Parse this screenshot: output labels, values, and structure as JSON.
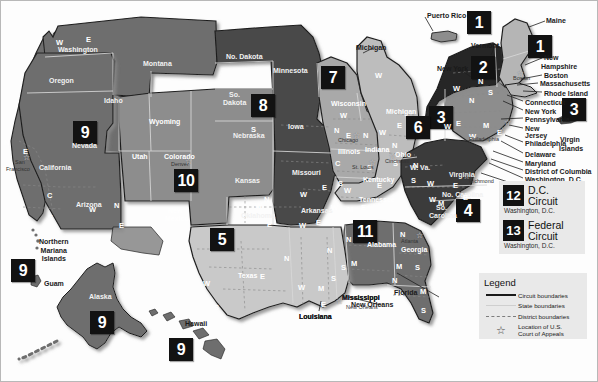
{
  "legend": {
    "title": "Legend",
    "items": [
      {
        "key": "circuit-boundary-line",
        "label": "Circuit boundaries"
      },
      {
        "key": "state-boundary-line",
        "label": "State boundaries"
      },
      {
        "key": "district-boundary-line",
        "label": "District boundaries"
      },
      {
        "key": "court-location-star",
        "label": "Location of U.S.\nCourt of Appeals"
      }
    ],
    "court_location_line1": "Location of U.S.",
    "court_location_line2": "Court of Appeals"
  },
  "special_circuits": [
    {
      "number": "12",
      "name_line1": "D.C.",
      "name_line2": "Circuit",
      "city": "Washington, D.C."
    },
    {
      "number": "13",
      "name_line1": "Federal",
      "name_line2": "Circuit",
      "city": "Washington, D.C."
    }
  ],
  "circuit_badges": [
    {
      "number": "1",
      "x": 466,
      "y": 10,
      "size": "lg",
      "name": "circuit-badge-1-puerto-rico"
    },
    {
      "number": "1",
      "x": 527,
      "y": 34,
      "size": "lg",
      "name": "circuit-badge-1-new-england"
    },
    {
      "number": "2",
      "x": 470,
      "y": 55,
      "size": "lg",
      "name": "circuit-badge-2"
    },
    {
      "number": "3",
      "x": 428,
      "y": 105,
      "size": "lg",
      "name": "circuit-badge-3-pennsylvania"
    },
    {
      "number": "3",
      "x": 561,
      "y": 97,
      "size": "lg",
      "name": "circuit-badge-3-virgin-islands"
    },
    {
      "number": "4",
      "x": 455,
      "y": 198,
      "size": "lg",
      "name": "circuit-badge-4"
    },
    {
      "number": "5",
      "x": 209,
      "y": 227,
      "size": "lg",
      "name": "circuit-badge-5"
    },
    {
      "number": "6",
      "x": 405,
      "y": 115,
      "size": "lg",
      "name": "circuit-badge-6"
    },
    {
      "number": "7",
      "x": 320,
      "y": 65,
      "size": "lg",
      "name": "circuit-badge-7"
    },
    {
      "number": "8",
      "x": 250,
      "y": 93,
      "size": "lg",
      "name": "circuit-badge-8"
    },
    {
      "number": "9",
      "x": 72,
      "y": 120,
      "size": "lg",
      "name": "circuit-badge-9-nevada"
    },
    {
      "number": "9",
      "x": 10,
      "y": 258,
      "size": "lg",
      "name": "circuit-badge-9-northern-mariana"
    },
    {
      "number": "9",
      "x": 89,
      "y": 310,
      "size": "lg",
      "name": "circuit-badge-9-alaska"
    },
    {
      "number": "9",
      "x": 168,
      "y": 337,
      "size": "lg",
      "name": "circuit-badge-9-hawaii"
    },
    {
      "number": "10",
      "x": 173,
      "y": 168,
      "size": "lg",
      "name": "circuit-badge-10"
    },
    {
      "number": "11",
      "x": 352,
      "y": 219,
      "size": "lg",
      "name": "circuit-badge-11"
    }
  ],
  "state_labels": [
    {
      "text": "Washington",
      "x": 57,
      "y": 45,
      "tone": "dk"
    },
    {
      "text": "Oregon",
      "x": 48,
      "y": 76,
      "tone": "dk"
    },
    {
      "text": "Idaho",
      "x": 103,
      "y": 96,
      "tone": "dk"
    },
    {
      "text": "Montana",
      "x": 142,
      "y": 59,
      "tone": "dk"
    },
    {
      "text": "Wyoming",
      "x": 148,
      "y": 117,
      "tone": "lt"
    },
    {
      "text": "Nevada",
      "x": 71,
      "y": 141,
      "tone": "dk"
    },
    {
      "text": "California",
      "x": 38,
      "y": 163,
      "tone": "dk"
    },
    {
      "text": "Utah",
      "x": 131,
      "y": 152,
      "tone": "lt"
    },
    {
      "text": "Colorado",
      "x": 163,
      "y": 152,
      "tone": "lt"
    },
    {
      "text": "Arizona",
      "x": 75,
      "y": 200,
      "tone": "dk"
    },
    {
      "text": "New",
      "x": 167,
      "y": 206,
      "tone": "lt"
    },
    {
      "text": "Mexico",
      "x": 164,
      "y": 214,
      "tone": "lt"
    },
    {
      "text": "No. Dakota",
      "x": 225,
      "y": 52,
      "tone": "dk"
    },
    {
      "text": "So.",
      "x": 228,
      "y": 90,
      "tone": "dk"
    },
    {
      "text": "Dakota",
      "x": 222,
      "y": 98,
      "tone": "dk"
    },
    {
      "text": "Nebraska",
      "x": 232,
      "y": 131,
      "tone": "dk"
    },
    {
      "text": "Kansas",
      "x": 234,
      "y": 176,
      "tone": "dk"
    },
    {
      "text": "Oklahoma",
      "x": 240,
      "y": 211,
      "tone": "dk"
    },
    {
      "text": "Minnesota",
      "x": 272,
      "y": 66,
      "tone": "dk"
    },
    {
      "text": "Iowa",
      "x": 287,
      "y": 122,
      "tone": "dk"
    },
    {
      "text": "Missouri",
      "x": 291,
      "y": 168,
      "tone": "dk"
    },
    {
      "text": "Arkansas",
      "x": 300,
      "y": 206,
      "tone": "dk"
    },
    {
      "text": "Texas",
      "x": 237,
      "y": 271,
      "tone": "lt"
    },
    {
      "text": "Louisiana",
      "x": 298,
      "y": 312,
      "tone": "out"
    },
    {
      "text": "Mississippi",
      "x": 341,
      "y": 293,
      "tone": "out"
    },
    {
      "text": "Wisconsin",
      "x": 330,
      "y": 99,
      "tone": "lt"
    },
    {
      "text": "Michigan",
      "x": 355,
      "y": 43,
      "tone": "out"
    },
    {
      "text": "Michigan",
      "x": 385,
      "y": 107,
      "tone": "lt"
    },
    {
      "text": "Illinois",
      "x": 337,
      "y": 147,
      "tone": "lt"
    },
    {
      "text": "Indiana",
      "x": 364,
      "y": 145,
      "tone": "lt"
    },
    {
      "text": "Ohio",
      "x": 394,
      "y": 150,
      "tone": "lt"
    },
    {
      "text": "Kentucky",
      "x": 362,
      "y": 175,
      "tone": "lt"
    },
    {
      "text": "Tennessee",
      "x": 358,
      "y": 195,
      "tone": "lt"
    },
    {
      "text": "Alabama",
      "x": 366,
      "y": 240,
      "tone": "lt"
    },
    {
      "text": "Georgia",
      "x": 400,
      "y": 245,
      "tone": "lt"
    },
    {
      "text": "Florida",
      "x": 393,
      "y": 288,
      "tone": "out"
    },
    {
      "text": "W. Va.",
      "x": 409,
      "y": 163,
      "tone": "dk"
    },
    {
      "text": "Virginia",
      "x": 448,
      "y": 170,
      "tone": "dk"
    },
    {
      "text": "No. Carolina",
      "x": 441,
      "y": 190,
      "tone": "dk"
    },
    {
      "text": "So.",
      "x": 435,
      "y": 203,
      "tone": "dk"
    },
    {
      "text": "Carolina",
      "x": 428,
      "y": 211,
      "tone": "dk"
    },
    {
      "text": "Alaska",
      "x": 88,
      "y": 292,
      "tone": "dk"
    },
    {
      "text": "Hawaii",
      "x": 184,
      "y": 319,
      "tone": "out"
    }
  ],
  "district_letters": [
    {
      "text": "W",
      "x": 55,
      "y": 37
    },
    {
      "text": "E",
      "x": 85,
      "y": 34
    },
    {
      "text": "N",
      "x": 3,
      "y": 137
    },
    {
      "text": "E",
      "x": 22,
      "y": 146
    },
    {
      "text": "C",
      "x": 46,
      "y": 190
    },
    {
      "text": "S",
      "x": 47,
      "y": 212
    },
    {
      "text": "W",
      "x": 88,
      "y": 204
    },
    {
      "text": "N",
      "x": 113,
      "y": 200
    },
    {
      "text": "E",
      "x": 118,
      "y": 220
    },
    {
      "text": "W",
      "x": 254,
      "y": 200
    },
    {
      "text": "N",
      "x": 263,
      "y": 194
    },
    {
      "text": "E",
      "x": 266,
      "y": 219
    },
    {
      "text": "W",
      "x": 299,
      "y": 189
    },
    {
      "text": "E",
      "x": 321,
      "y": 182
    },
    {
      "text": "W",
      "x": 298,
      "y": 220
    },
    {
      "text": "E",
      "x": 315,
      "y": 217
    },
    {
      "text": "N",
      "x": 283,
      "y": 253
    },
    {
      "text": "W",
      "x": 202,
      "y": 278
    },
    {
      "text": "S",
      "x": 213,
      "y": 302
    },
    {
      "text": "E",
      "x": 259,
      "y": 271
    },
    {
      "text": "W",
      "x": 297,
      "y": 282
    },
    {
      "text": "M",
      "x": 317,
      "y": 283
    },
    {
      "text": "E",
      "x": 320,
      "y": 299
    },
    {
      "text": "N",
      "x": 326,
      "y": 245
    },
    {
      "text": "S",
      "x": 330,
      "y": 273
    },
    {
      "text": "W",
      "x": 339,
      "y": 110
    },
    {
      "text": "E",
      "x": 345,
      "y": 130
    },
    {
      "text": "N",
      "x": 333,
      "y": 125
    },
    {
      "text": "C",
      "x": 334,
      "y": 158
    },
    {
      "text": "S",
      "x": 337,
      "y": 178
    },
    {
      "text": "N",
      "x": 362,
      "y": 130
    },
    {
      "text": "S",
      "x": 366,
      "y": 162
    },
    {
      "text": "W",
      "x": 343,
      "y": 185
    },
    {
      "text": "E",
      "x": 376,
      "y": 180
    },
    {
      "text": "W",
      "x": 330,
      "y": 202
    },
    {
      "text": "M",
      "x": 346,
      "y": 204
    },
    {
      "text": "E",
      "x": 360,
      "y": 202
    },
    {
      "text": "W",
      "x": 374,
      "y": 70
    },
    {
      "text": "W",
      "x": 378,
      "y": 127
    },
    {
      "text": "E",
      "x": 396,
      "y": 120
    },
    {
      "text": "N",
      "x": 391,
      "y": 140
    },
    {
      "text": "S",
      "x": 392,
      "y": 158
    },
    {
      "text": "N",
      "x": 345,
      "y": 234
    },
    {
      "text": "M",
      "x": 350,
      "y": 258
    },
    {
      "text": "S",
      "x": 340,
      "y": 262
    },
    {
      "text": "N",
      "x": 399,
      "y": 229
    },
    {
      "text": "M",
      "x": 395,
      "y": 261
    },
    {
      "text": "S",
      "x": 414,
      "y": 262
    },
    {
      "text": "N",
      "x": 391,
      "y": 275
    },
    {
      "text": "M",
      "x": 419,
      "y": 286
    },
    {
      "text": "S",
      "x": 420,
      "y": 305
    },
    {
      "text": "N",
      "x": 412,
      "y": 160
    },
    {
      "text": "S",
      "x": 410,
      "y": 175
    },
    {
      "text": "W",
      "x": 426,
      "y": 178
    },
    {
      "text": "E",
      "x": 452,
      "y": 180
    },
    {
      "text": "W",
      "x": 428,
      "y": 194
    },
    {
      "text": "M",
      "x": 437,
      "y": 198
    },
    {
      "text": "E",
      "x": 462,
      "y": 192
    },
    {
      "text": "W",
      "x": 443,
      "y": 121
    },
    {
      "text": "N",
      "x": 468,
      "y": 95
    },
    {
      "text": "M",
      "x": 482,
      "y": 120
    },
    {
      "text": "W",
      "x": 468,
      "y": 131
    },
    {
      "text": "E",
      "x": 496,
      "y": 127
    },
    {
      "text": "N",
      "x": 477,
      "y": 76
    },
    {
      "text": "W",
      "x": 452,
      "y": 83
    },
    {
      "text": "S",
      "x": 487,
      "y": 87
    },
    {
      "text": "E",
      "x": 455,
      "y": 118
    },
    {
      "text": "S",
      "x": 250,
      "y": 124
    }
  ],
  "cities": [
    {
      "text": "San",
      "x": 14,
      "y": 158
    },
    {
      "text": "Francisco",
      "x": 5,
      "y": 165
    },
    {
      "text": "Denver",
      "x": 170,
      "y": 160
    },
    {
      "text": "Chicago",
      "x": 337,
      "y": 136
    },
    {
      "text": "St. Louis",
      "x": 351,
      "y": 163
    },
    {
      "text": "Cincinnati",
      "x": 384,
      "y": 157
    },
    {
      "text": "Atlanta",
      "x": 400,
      "y": 237
    },
    {
      "text": "New Orleans",
      "x": 345,
      "y": 303
    },
    {
      "text": "Boston",
      "x": 512,
      "y": 74
    },
    {
      "text": "Richmond",
      "x": 468,
      "y": 177
    },
    {
      "text": "Philadelphia",
      "x": 468,
      "y": 135
    }
  ],
  "callout_labels": [
    {
      "text": "Puerto Rico",
      "x": 426,
      "y": 11
    },
    {
      "text": "Maine",
      "x": 545,
      "y": 16
    },
    {
      "text": "Vermont",
      "x": 470,
      "y": 41
    },
    {
      "text": "New York",
      "x": 436,
      "y": 64
    },
    {
      "text": "New",
      "x": 543,
      "y": 53
    },
    {
      "text": "Hampshire",
      "x": 540,
      "y": 62
    },
    {
      "text": "Boston",
      "x": 543,
      "y": 71
    },
    {
      "text": "Massachusetts",
      "x": 539,
      "y": 79
    },
    {
      "text": "Rhode Island",
      "x": 543,
      "y": 89
    },
    {
      "text": "Connecticut",
      "x": 524,
      "y": 98
    },
    {
      "text": "New York",
      "x": 524,
      "y": 107
    },
    {
      "text": "Pennsylvania",
      "x": 524,
      "y": 115
    },
    {
      "text": "New",
      "x": 524,
      "y": 124
    },
    {
      "text": "Jersey",
      "x": 524,
      "y": 131
    },
    {
      "text": "Philadelphia",
      "x": 524,
      "y": 139
    },
    {
      "text": "Delaware",
      "x": 524,
      "y": 150
    },
    {
      "text": "Maryland",
      "x": 524,
      "y": 159
    },
    {
      "text": "District of Columbia",
      "x": 524,
      "y": 167
    },
    {
      "text": "Washington, D.C.",
      "x": 524,
      "y": 175
    },
    {
      "text": "Richmond",
      "x": 524,
      "y": 184
    },
    {
      "text": "Virgin",
      "x": 559,
      "y": 135
    },
    {
      "text": "Islands",
      "x": 558,
      "y": 144
    },
    {
      "text": "Mississippi",
      "x": 341,
      "y": 293
    },
    {
      "text": "New Orleans",
      "x": 350,
      "y": 300
    },
    {
      "text": "Louisiana",
      "x": 298,
      "y": 312
    }
  ],
  "territories": [
    {
      "lines": [
        "Northern",
        "Mariana",
        "Islands"
      ],
      "x": 38,
      "y": 237
    },
    {
      "lines": [
        "Guam"
      ],
      "x": 43,
      "y": 279
    }
  ]
}
